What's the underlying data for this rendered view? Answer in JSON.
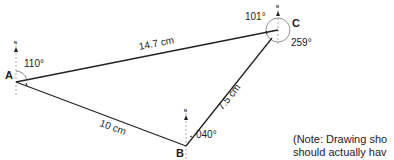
{
  "diagram": {
    "points": {
      "A": {
        "label": "A",
        "bearing_label": "110°"
      },
      "B": {
        "label": "B",
        "bearing_label": "040°"
      },
      "C": {
        "label": "C",
        "bearing_label_1": "101°",
        "bearing_label_2": "259°"
      }
    },
    "north_label": "N",
    "sides": {
      "AC": "14.7 cm",
      "AB": "10 cm",
      "BC": "7.5 cm"
    },
    "note": {
      "line1": "(Note: Drawing sho",
      "line2": "should actually hav"
    },
    "colors": {
      "line": "#222222",
      "dashed": "#888888"
    }
  }
}
